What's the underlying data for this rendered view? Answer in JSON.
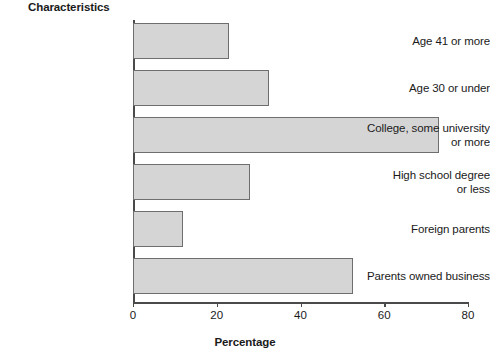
{
  "chart_data": {
    "type": "bar",
    "orientation": "horizontal",
    "title": "",
    "xlabel": "Percentage",
    "ylabel": "Characteristics",
    "xlim": [
      0,
      80
    ],
    "xticks": [
      0,
      20,
      40,
      60,
      80
    ],
    "grid": false,
    "legend": null,
    "bar_color": "#d5d5d5",
    "bar_border_color": "#6e6e6e",
    "axis_color": "#4a4a4a",
    "text_color": "#1a1a1a",
    "categories": [
      "Age 41 or more",
      "Age 30 or under",
      "College, some university or more",
      "High school degree or less",
      "Foreign parents",
      "Parents owned business"
    ],
    "category_lines": [
      [
        "Age 41 or more"
      ],
      [
        "Age 30 or under"
      ],
      [
        "College, some university",
        "or more"
      ],
      [
        "High school degree",
        "or less"
      ],
      [
        "Foreign parents"
      ],
      [
        "Parents owned business"
      ]
    ],
    "values": [
      23,
      32.5,
      73,
      28,
      12,
      52.5
    ]
  }
}
